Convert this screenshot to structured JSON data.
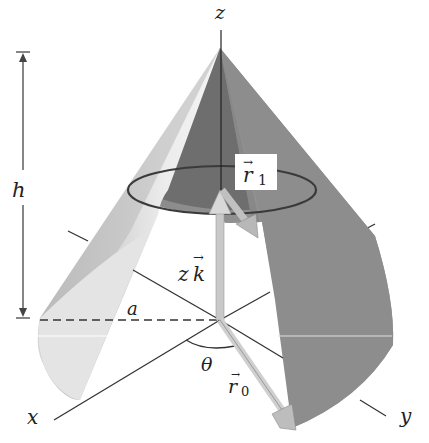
{
  "figure": {
    "labels": {
      "z_axis": "z",
      "x_axis": "x",
      "y_axis": "y",
      "height": "h",
      "radius": "a",
      "angle": "θ",
      "vector_zk": "zk",
      "vector_zk_letter_z": "z",
      "vector_zk_letter_k": "k",
      "vector_r0_letter": "r",
      "vector_r0_sub": "0",
      "vector_r1_letter": "r",
      "vector_r1_sub": "1",
      "arrow_accent": "→"
    },
    "colors": {
      "background": "#ffffff",
      "cone_light": "#e8e8e8",
      "cone_mid": "#c4c4c4",
      "cone_dark": "#8c8c8c",
      "cone_darkest": "#7a7a7a",
      "arrow_fill": "#c8c8c8",
      "line": "#333333"
    }
  }
}
